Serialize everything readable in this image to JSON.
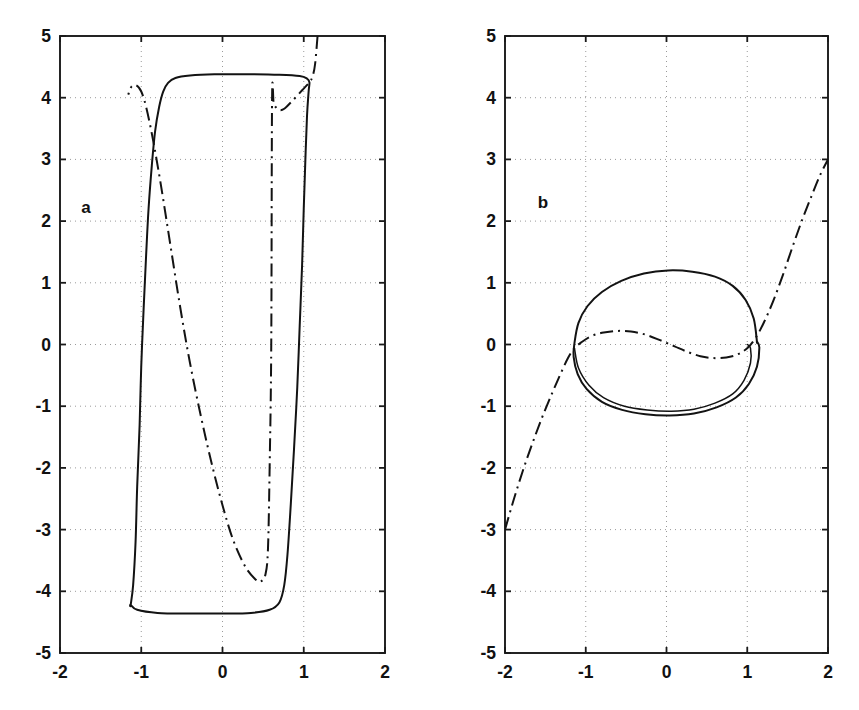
{
  "figure": {
    "background_color": "#ffffff",
    "line_color": "#131313",
    "grid_color": "#9a9a9a",
    "width": 859,
    "height": 710
  },
  "panels": [
    {
      "id": "a",
      "label": "a"
    },
    {
      "id": "b",
      "label": "b"
    }
  ],
  "axis": {
    "x_ticks": [
      "-2",
      "-1",
      "0",
      "1",
      "2"
    ],
    "y_ticks": [
      "5",
      "4",
      "3",
      "2",
      "1",
      "0",
      "-1",
      "-2",
      "-3",
      "-4",
      "-5"
    ],
    "x_tick_values": [
      -2,
      -1,
      0,
      1,
      2
    ],
    "y_tick_values": [
      5,
      4,
      3,
      2,
      1,
      0,
      -1,
      -2,
      -3,
      -4,
      -5
    ],
    "xlim": [
      -2,
      2
    ],
    "ylim": [
      -5,
      5
    ],
    "grid": true
  },
  "chart_data": [
    {
      "type": "line",
      "title": "a",
      "xlabel": "",
      "ylabel": "",
      "xlim": [
        -2,
        2
      ],
      "ylim": [
        -5,
        5
      ],
      "grid": true,
      "legend": "none",
      "series": [
        {
          "name": "relaxation-limit-cycle",
          "style": "solid",
          "closed": true,
          "description": "Large relaxation oscillation limit cycle: near-rectangular orbit with flat plateaus at y=+4.35 and y=-4.35 and steep near-vertical branches at x=-1.05 and x=1.0",
          "points": [
            [
              -1.13,
              -4.22
            ],
            [
              -1.05,
              -4.3
            ],
            [
              -0.8,
              -4.35
            ],
            [
              -0.4,
              -4.36
            ],
            [
              0.0,
              -4.36
            ],
            [
              0.35,
              -4.35
            ],
            [
              0.58,
              -4.3
            ],
            [
              0.7,
              -4.18
            ],
            [
              0.76,
              -3.9
            ],
            [
              0.8,
              -3.4
            ],
            [
              0.84,
              -2.6
            ],
            [
              0.88,
              -1.7
            ],
            [
              0.92,
              -0.7
            ],
            [
              0.95,
              0.3
            ],
            [
              0.98,
              1.3
            ],
            [
              1.0,
              2.2
            ],
            [
              1.02,
              3.0
            ],
            [
              1.04,
              3.7
            ],
            [
              1.06,
              4.1
            ],
            [
              1.07,
              4.25
            ],
            [
              1.04,
              4.31
            ],
            [
              0.95,
              4.35
            ],
            [
              0.7,
              4.37
            ],
            [
              0.3,
              4.38
            ],
            [
              -0.1,
              4.38
            ],
            [
              -0.4,
              4.36
            ],
            [
              -0.58,
              4.32
            ],
            [
              -0.67,
              4.24
            ],
            [
              -0.73,
              4.1
            ],
            [
              -0.78,
              3.85
            ],
            [
              -0.83,
              3.45
            ],
            [
              -0.87,
              2.9
            ],
            [
              -0.91,
              2.2
            ],
            [
              -0.94,
              1.45
            ],
            [
              -0.97,
              0.6
            ],
            [
              -1.0,
              -0.35
            ],
            [
              -1.02,
              -1.3
            ],
            [
              -1.05,
              -2.3
            ],
            [
              -1.07,
              -3.2
            ],
            [
              -1.1,
              -3.9
            ],
            [
              -1.13,
              -4.22
            ]
          ]
        },
        {
          "name": "cubic-nullcline-trajectory",
          "style": "dash-dot",
          "closed": false,
          "description": "Cubic-shaped dash-dot curve entering at top near x=1.16,y=5, passing down to a local maximum near (-0.60, 3.90), descending steeply through the origin region and exiting at bottom near x=-1.16,y=-5",
          "points": [
            [
              1.17,
              5.0
            ],
            [
              1.14,
              4.55
            ],
            [
              1.11,
              4.35
            ],
            [
              1.07,
              4.25
            ],
            [
              0.98,
              4.12
            ],
            [
              0.86,
              3.95
            ],
            [
              0.76,
              3.82
            ],
            [
              0.7,
              3.8
            ],
            [
              0.66,
              3.84
            ],
            [
              0.63,
              3.9
            ],
            [
              0.61,
              3.97
            ],
            [
              0.6,
              -0.0
            ],
            [
              0.58,
              -2.0
            ],
            [
              0.56,
              -3.3
            ],
            [
              0.53,
              -3.72
            ],
            [
              0.47,
              -3.84
            ],
            [
              0.4,
              -3.8
            ],
            [
              0.28,
              -3.6
            ],
            [
              0.14,
              -3.2
            ],
            [
              0.02,
              -2.7
            ],
            [
              -0.12,
              -2.0
            ],
            [
              -0.26,
              -1.2
            ],
            [
              -0.4,
              -0.3
            ],
            [
              -0.52,
              0.6
            ],
            [
              -0.64,
              1.6
            ],
            [
              -0.76,
              2.6
            ],
            [
              -0.86,
              3.35
            ],
            [
              -0.94,
              3.85
            ],
            [
              -1.0,
              4.1
            ],
            [
              -1.06,
              4.2
            ],
            [
              -1.12,
              4.18
            ],
            [
              -1.16,
              4.05
            ]
          ]
        }
      ]
    },
    {
      "type": "line",
      "title": "b",
      "xlabel": "",
      "ylabel": "",
      "xlim": [
        -2,
        2
      ],
      "ylim": [
        -5,
        5
      ],
      "grid": true,
      "legend": "none",
      "series": [
        {
          "name": "quasi-harmonic-limit-cycle",
          "style": "solid",
          "closed": true,
          "description": "Small near-elliptical limit cycle centred near (0,0) with extents x in [-1.15, 1.15] and y in [-1.15, 1.20], traced twice showing a tight inward spiral along the lower arc",
          "points": [
            [
              1.12,
              0.05
            ],
            [
              1.08,
              0.42
            ],
            [
              0.98,
              0.72
            ],
            [
              0.82,
              0.95
            ],
            [
              0.6,
              1.1
            ],
            [
              0.32,
              1.18
            ],
            [
              0.02,
              1.2
            ],
            [
              -0.28,
              1.15
            ],
            [
              -0.56,
              1.03
            ],
            [
              -0.8,
              0.85
            ],
            [
              -0.98,
              0.62
            ],
            [
              -1.09,
              0.35
            ],
            [
              -1.14,
              0.02
            ],
            [
              -1.15,
              -0.2
            ],
            [
              -1.1,
              -0.48
            ],
            [
              -0.99,
              -0.72
            ],
            [
              -0.8,
              -0.93
            ],
            [
              -0.55,
              -1.06
            ],
            [
              -0.26,
              -1.13
            ],
            [
              0.04,
              -1.15
            ],
            [
              0.34,
              -1.12
            ],
            [
              0.62,
              -1.02
            ],
            [
              0.86,
              -0.86
            ],
            [
              1.02,
              -0.64
            ],
            [
              1.12,
              -0.36
            ],
            [
              1.15,
              -0.05
            ],
            [
              1.12,
              0.05
            ]
          ]
        },
        {
          "name": "quasi-harmonic-limit-cycle-inner-turn",
          "style": "solid",
          "closed": false,
          "description": "Second inner pass of the same orbit, slightly inside the outer loop on the lower half, ending at x=1.0,y=0.0",
          "points": [
            [
              -1.14,
              -0.06
            ],
            [
              -1.09,
              -0.38
            ],
            [
              -0.96,
              -0.66
            ],
            [
              -0.78,
              -0.86
            ],
            [
              -0.52,
              -1.0
            ],
            [
              -0.24,
              -1.06
            ],
            [
              0.06,
              -1.08
            ],
            [
              0.34,
              -1.05
            ],
            [
              0.6,
              -0.95
            ],
            [
              0.82,
              -0.8
            ],
            [
              0.96,
              -0.58
            ],
            [
              1.04,
              -0.3
            ],
            [
              1.04,
              -0.06
            ],
            [
              1.0,
              0.0
            ]
          ]
        },
        {
          "name": "cubic-nullcline-trajectory",
          "style": "dash-dot",
          "closed": false,
          "description": "Dash-dot cubic nullcline entering bottom-left at (-2, -3), rising through (-1.2, -0.15), flattening into a shallow hump with maximum near (-0.55, 0.22) and minimum near (0.5, -0.22), then rising steeply to exit at (2, 3)",
          "points": [
            [
              -2.0,
              -3.0
            ],
            [
              -1.9,
              -2.55
            ],
            [
              -1.78,
              -2.05
            ],
            [
              -1.66,
              -1.6
            ],
            [
              -1.54,
              -1.18
            ],
            [
              -1.42,
              -0.8
            ],
            [
              -1.32,
              -0.5
            ],
            [
              -1.22,
              -0.22
            ],
            [
              -1.14,
              -0.06
            ],
            [
              -1.05,
              0.04
            ],
            [
              -0.94,
              0.13
            ],
            [
              -0.8,
              0.19
            ],
            [
              -0.62,
              0.22
            ],
            [
              -0.44,
              0.21
            ],
            [
              -0.26,
              0.16
            ],
            [
              -0.08,
              0.07
            ],
            [
              0.1,
              -0.03
            ],
            [
              0.26,
              -0.12
            ],
            [
              0.42,
              -0.19
            ],
            [
              0.58,
              -0.22
            ],
            [
              0.74,
              -0.21
            ],
            [
              0.88,
              -0.16
            ],
            [
              1.0,
              -0.06
            ],
            [
              1.1,
              0.1
            ],
            [
              1.2,
              0.34
            ],
            [
              1.32,
              0.7
            ],
            [
              1.44,
              1.12
            ],
            [
              1.56,
              1.58
            ],
            [
              1.68,
              2.02
            ],
            [
              1.8,
              2.42
            ],
            [
              1.9,
              2.74
            ],
            [
              2.0,
              3.0
            ]
          ]
        }
      ]
    }
  ]
}
